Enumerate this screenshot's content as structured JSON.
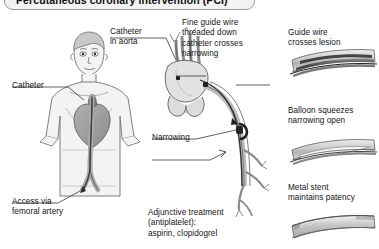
{
  "header": {
    "title": "Percutaneous coronary intervention (PCI)"
  },
  "panels": {
    "left": {
      "name": "body-access-panel",
      "labels": {
        "catheter": "Catheter",
        "access": "Access via\nfemoral artery"
      }
    },
    "middle": {
      "name": "heart-catheter-panel",
      "labels": {
        "catheter_in_aorta": "Catheter\nin aorta",
        "guide_wire": "Fine guide wire\nthreaded down\ncatheter crosses\nnarrowing",
        "narrowing": "Narrowing",
        "adjunctive": "Adjunctive treatment\n(antiplatelet):\naspirin, clopidogrel"
      }
    },
    "right": {
      "name": "vessel-sequence-panel",
      "steps": [
        {
          "id": "guide-wire-step",
          "label": "Guide wire\ncrosses lesion"
        },
        {
          "id": "balloon-step",
          "label": "Balloon squeezes\nnarrowing open"
        },
        {
          "id": "stent-step",
          "label": "Metal stent\nmaintains patency"
        }
      ]
    }
  },
  "colors": {
    "ink": "#141414",
    "outline": "#6f6f6f",
    "skin_fill": "#f3f3f3",
    "organ_fill": "#9d9d9d",
    "vessel_fill": "#c9c9c9",
    "plaque": "#2f2f2f",
    "chip_bg": "#f2f2f2",
    "chip_border": "#9a9a9a",
    "page_bg": "#ffffff"
  }
}
